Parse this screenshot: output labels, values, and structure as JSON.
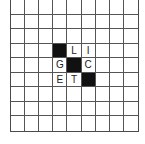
{
  "puzzle": {
    "rows": 9,
    "cols": 9,
    "colors": {
      "block": "#111111",
      "grid_line": "#555555",
      "background": "#ffffff"
    },
    "cells": [
      [
        "",
        "",
        "",
        "",
        "",
        "",
        "",
        "",
        ""
      ],
      [
        "",
        "",
        "",
        "",
        "",
        "",
        "",
        "",
        ""
      ],
      [
        "",
        "",
        "",
        "",
        "",
        "",
        "",
        "",
        ""
      ],
      [
        "",
        "",
        "",
        "#",
        "L",
        "I",
        "",
        "",
        ""
      ],
      [
        "",
        "",
        "",
        "G",
        "#",
        "C",
        "",
        "",
        ""
      ],
      [
        "",
        "",
        "",
        "E",
        "T",
        "#",
        "",
        "",
        ""
      ],
      [
        "",
        "",
        "",
        "",
        "",
        "",
        "",
        "",
        ""
      ],
      [
        "",
        "",
        "",
        "",
        "",
        "",
        "",
        "",
        ""
      ],
      [
        "",
        "",
        "",
        "",
        "",
        "",
        "",
        "",
        ""
      ]
    ]
  }
}
